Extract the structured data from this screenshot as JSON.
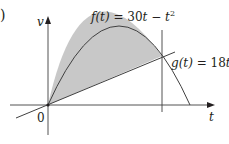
{
  "part_label": ")",
  "axes": {
    "y_label": "v",
    "x_label": "t",
    "origin_label": "0"
  },
  "curves": {
    "f": {
      "label_name": "f(t)",
      "label_eq": " = 30",
      "label_t": "t",
      "label_minus": " − ",
      "label_t2": "t",
      "label_exp": "2",
      "full": "f(t) = 30t − t²"
    },
    "g": {
      "label_name": "g(t)",
      "label_eq": " = 18",
      "label_t": "t",
      "full": "g(t) = 18t"
    }
  },
  "colors": {
    "shade": "#c8c8c8",
    "line": "#404040",
    "text": "#231f20"
  }
}
